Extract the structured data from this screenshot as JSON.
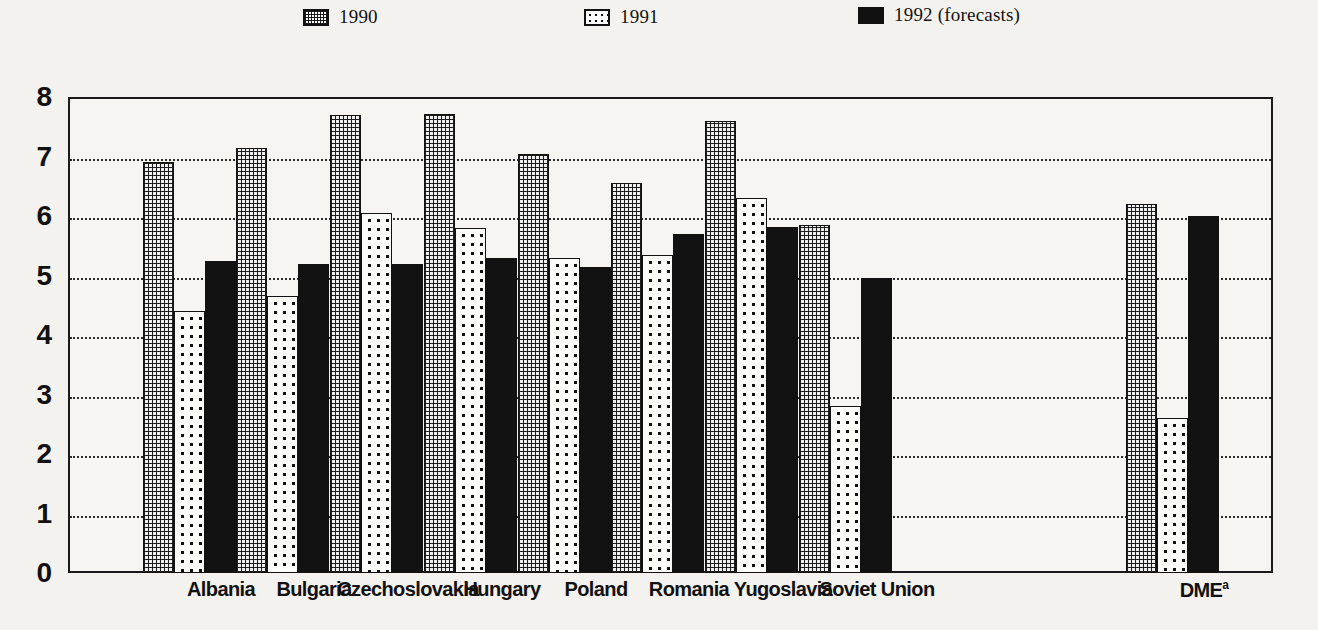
{
  "legend": {
    "items": [
      {
        "label": "1990",
        "key": "y1990",
        "swatch": "dense-grid-hatch-swatch"
      },
      {
        "label": "1991",
        "key": "y1991",
        "swatch": "sparse-dot-swatch"
      },
      {
        "label": "1992 (forecasts)",
        "key": "y1992",
        "swatch": "solid-black-swatch"
      }
    ]
  },
  "axis": {
    "y_ticks": [
      "0",
      "1",
      "2",
      "3",
      "4",
      "5",
      "6",
      "7",
      "8"
    ]
  },
  "footnote_marker": "a",
  "chart_data": {
    "type": "bar",
    "title": "",
    "subtitle": "",
    "xlabel": "",
    "ylabel": "",
    "ylim": [
      0,
      8
    ],
    "ytick_step": 1,
    "grid": true,
    "legend_position": "top",
    "categories": [
      "Albania",
      "Bulgaria",
      "Czechoslovakia",
      "Hungary",
      "Poland",
      "Romania",
      "Yugoslavia",
      "Soviet Union",
      "DME"
    ],
    "series": [
      {
        "name": "1990",
        "values": [
          6.9,
          7.15,
          7.7,
          7.72,
          7.05,
          6.55,
          7.6,
          5.85,
          6.2
        ]
      },
      {
        "name": "1991",
        "values": [
          4.4,
          4.65,
          6.05,
          5.8,
          5.3,
          5.35,
          6.3,
          2.8,
          2.6
        ]
      },
      {
        "name": "1992 (forecasts)",
        "values": [
          5.25,
          5.2,
          5.2,
          5.3,
          5.15,
          5.7,
          5.82,
          4.95,
          6.0
        ]
      }
    ],
    "colors": {
      "y1990": "#efefef",
      "y1991": "#fbfbf8",
      "y1992": "#121212",
      "axis": "#1a1a1a",
      "grid": "#2b2b2b"
    }
  },
  "layout": {
    "plot_left": 68,
    "plot_top": 97,
    "plot_width": 1205,
    "plot_height": 476,
    "bar_width": 31,
    "group_starts": [
      75,
      168,
      262,
      356,
      450,
      543,
      637,
      731,
      1058
    ],
    "label_centers": [
      221,
      314,
      408,
      502,
      596,
      689,
      783,
      877,
      1204
    ]
  }
}
